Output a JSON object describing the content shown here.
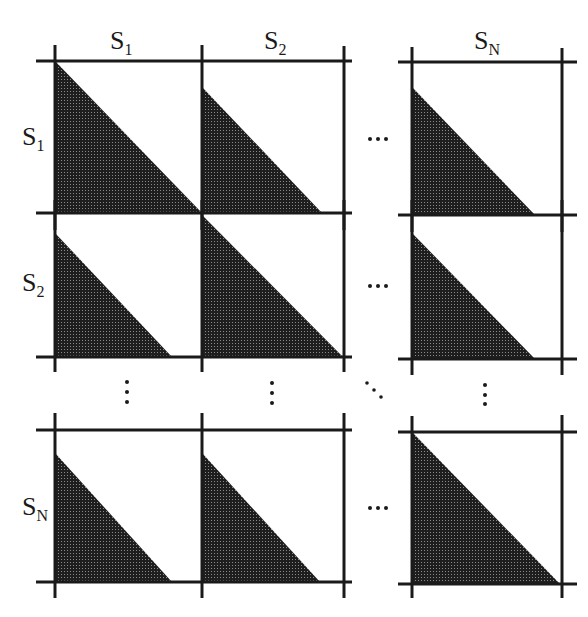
{
  "figure": {
    "caption_cut_text": "",
    "column_headers": [
      {
        "base": "S",
        "sub": "1"
      },
      {
        "base": "S",
        "sub": "2"
      },
      {
        "base": "S",
        "sub": "N"
      }
    ],
    "row_headers": [
      {
        "base": "S",
        "sub": "1"
      },
      {
        "base": "S",
        "sub": "2"
      },
      {
        "base": "S",
        "sub": "N"
      }
    ],
    "horizontal_ellipsis": "⋯",
    "vertical_ellipsis": "⋮",
    "diagonal_ellipsis": "⋱",
    "fill_color": "#2b2b2b",
    "line_color": "#1a1a1a",
    "cells": [
      {
        "row": "S1",
        "col": "S1",
        "shape": "full-lower-triangle"
      },
      {
        "row": "S1",
        "col": "S2",
        "shape": "partial-lower-triangle"
      },
      {
        "row": "S1",
        "col": "SN",
        "shape": "partial-lower-triangle"
      },
      {
        "row": "S2",
        "col": "S1",
        "shape": "partial-lower-triangle"
      },
      {
        "row": "S2",
        "col": "S2",
        "shape": "full-lower-triangle"
      },
      {
        "row": "S2",
        "col": "SN",
        "shape": "partial-lower-triangle"
      },
      {
        "row": "SN",
        "col": "S1",
        "shape": "partial-lower-triangle"
      },
      {
        "row": "SN",
        "col": "S2",
        "shape": "partial-lower-triangle"
      },
      {
        "row": "SN",
        "col": "SN",
        "shape": "full-lower-triangle"
      }
    ]
  }
}
